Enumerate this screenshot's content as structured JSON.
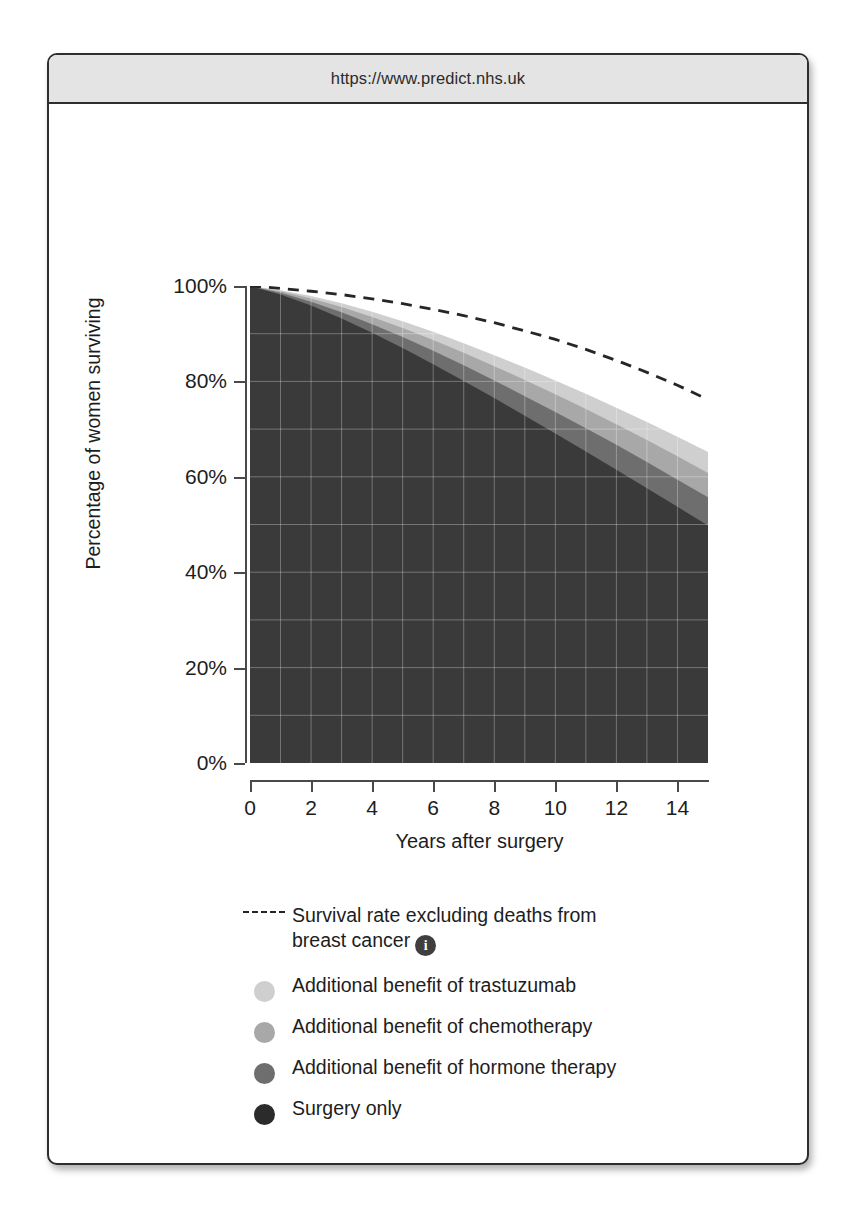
{
  "browser": {
    "url": "https://www.predict.nhs.uk"
  },
  "chart_data": {
    "type": "area",
    "title": "",
    "xlabel": "Years after surgery",
    "ylabel": "Percentage of women surviving",
    "xlim": [
      0,
      15
    ],
    "ylim": [
      0,
      100
    ],
    "xticks": [
      0,
      2,
      4,
      6,
      8,
      10,
      12,
      14
    ],
    "xtick_labels": [
      "0",
      "2",
      "4",
      "6",
      "8",
      "10",
      "12",
      "14"
    ],
    "yticks": [
      0,
      20,
      40,
      60,
      80,
      100
    ],
    "ytick_labels": [
      "0%",
      "20%",
      "40%",
      "60%",
      "80%",
      "100%"
    ],
    "grid": true,
    "grid_x_step": 1,
    "grid_y_step": 10,
    "legend_position": "below",
    "x": [
      0,
      1,
      2,
      3,
      4,
      5,
      6,
      7,
      8,
      9,
      10,
      11,
      12,
      13,
      14,
      15
    ],
    "series": [
      {
        "name": "Survival rate excluding deaths from breast cancer",
        "style": "dashed-line",
        "color": "#262626",
        "values": [
          100,
          99.5,
          98.9,
          98.2,
          97.3,
          96.3,
          95.1,
          93.8,
          92.3,
          90.6,
          88.8,
          86.7,
          84.4,
          81.9,
          79.2,
          76.2
        ]
      },
      {
        "name": "Additional benefit of trastuzumab",
        "style": "area-cumulative-top",
        "color": "#cfcfcf",
        "values": [
          100,
          99.1,
          97.9,
          96.4,
          94.6,
          92.6,
          90.4,
          88.0,
          85.5,
          82.9,
          80.2,
          77.4,
          74.5,
          71.5,
          68.4,
          65.2
        ]
      },
      {
        "name": "Additional benefit of chemotherapy",
        "style": "area-cumulative-top",
        "color": "#a8a8a8",
        "values": [
          100,
          98.9,
          97.4,
          95.6,
          93.5,
          91.2,
          88.7,
          86.0,
          83.2,
          80.3,
          77.3,
          74.2,
          71.0,
          67.7,
          64.3,
          60.8
        ]
      },
      {
        "name": "Additional benefit of hormone therapy",
        "style": "area-cumulative-top",
        "color": "#6e6e6e",
        "values": [
          100,
          98.6,
          96.7,
          94.5,
          92.0,
          89.3,
          86.4,
          83.4,
          80.2,
          76.9,
          73.6,
          70.2,
          66.7,
          63.1,
          59.4,
          55.7
        ]
      },
      {
        "name": "Surgery only",
        "style": "area-cumulative-top",
        "color": "#3a3a3a",
        "values": [
          100,
          98.2,
          95.9,
          93.2,
          90.2,
          87.0,
          83.6,
          80.1,
          76.5,
          72.8,
          69.1,
          65.3,
          61.5,
          57.6,
          53.7,
          49.8
        ]
      }
    ]
  },
  "legend": {
    "items": [
      {
        "kind": "dash",
        "label_line1": "Survival rate excluding deaths from",
        "label_line2": "breast cancer",
        "info": "i",
        "color": "#262626"
      },
      {
        "kind": "dot",
        "label": "Additional benefit of trastuzumab",
        "color": "#cfcfcf"
      },
      {
        "kind": "dot",
        "label": "Additional benefit of chemotherapy",
        "color": "#a8a8a8"
      },
      {
        "kind": "dot",
        "label": "Additional benefit of hormone therapy",
        "color": "#6e6e6e"
      },
      {
        "kind": "dot",
        "label": "Surgery only",
        "color": "#2b2b2b"
      }
    ]
  },
  "colors": {
    "axis": "#4a4a4a",
    "text": "#1d1d1d",
    "grid": "#d8d8d8",
    "url_bar_bg": "#e4e4e4",
    "card_border": "#2e2e2e"
  }
}
